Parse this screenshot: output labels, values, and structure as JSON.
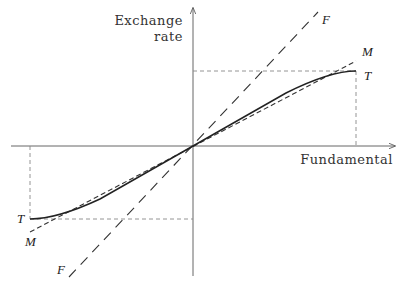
{
  "diagram": {
    "axes": {
      "y_label_line1": "Exchange",
      "y_label_line2": "rate",
      "x_label": "Fundamental"
    },
    "curves": [
      {
        "id": "F",
        "label": "F",
        "style": "long-dashed",
        "description": "steep linear line through origin"
      },
      {
        "id": "M",
        "label": "M",
        "style": "short-dashed",
        "description": "linear line through origin, tangent to T near origin"
      },
      {
        "id": "T",
        "label": "T",
        "style": "solid",
        "description": "S-shaped curve flattening at the bands"
      }
    ],
    "upper_T_label": "T",
    "lower_T_label": "T",
    "upper_M_label": "M",
    "lower_M_label": "M",
    "upper_F_label": "F",
    "lower_F_label": "F",
    "colors": {
      "axes": "#555555",
      "curve": "#222222",
      "guides": "#888888"
    }
  }
}
